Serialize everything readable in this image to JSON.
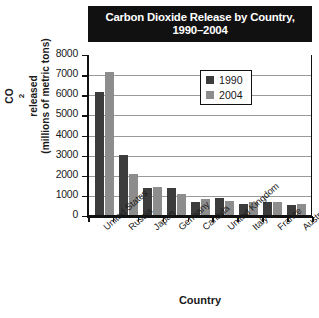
{
  "chart_data": {
    "type": "bar",
    "title_line1": "Carbon Dioxide Release by Country,",
    "title_line2": "1990–2004",
    "xlabel": "Country",
    "ylabel": "CO2 released (millions of metric tons)",
    "ylabel_line1_prefix": "CO",
    "ylabel_line1_sub": "2",
    "ylabel_line1_suffix": " released",
    "ylabel_line2": "(millions of metric tons)",
    "ylim": [
      0,
      8000
    ],
    "ytick_labels": [
      "8000",
      "7000",
      "6000",
      "5000",
      "4000",
      "3000",
      "2000",
      "1000",
      "0"
    ],
    "ytick_values": [
      8000,
      7000,
      6000,
      5000,
      4000,
      3000,
      2000,
      1000,
      0
    ],
    "grid": true,
    "legend_position": "upper right",
    "categories": [
      "United States",
      "Russia",
      "Japan",
      "Germany",
      "Canada",
      "United Kingdom",
      "Italy",
      "France",
      "Australia"
    ],
    "series": [
      {
        "name": "1990",
        "color": "#3c3c3c",
        "values": [
          6100,
          3000,
          1330,
          1330,
          630,
          850,
          550,
          670,
          500
        ]
      },
      {
        "name": "2004",
        "color": "#8d8d8d",
        "values": [
          7100,
          2030,
          1400,
          1050,
          800,
          710,
          660,
          670,
          550
        ]
      }
    ]
  },
  "colors": {
    "series_1990": "#3c3c3c",
    "series_2004": "#8d8d8d",
    "title_background": "#111111",
    "title_text": "#ffffff",
    "axis": "#111111",
    "gridline": "#9a9a9a",
    "page_background": "#ffffff"
  }
}
